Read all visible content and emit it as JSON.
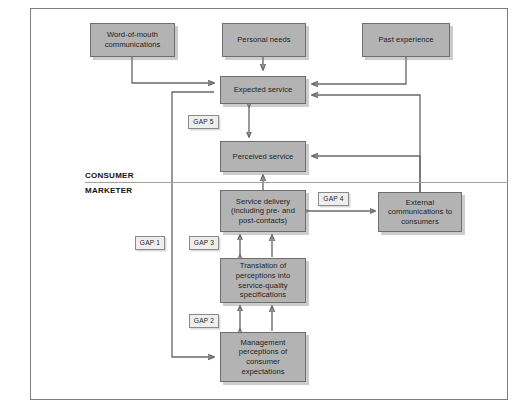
{
  "diagram": {
    "colors": {
      "box_fill": "#b3b3b3",
      "box_border": "#6e6e6e",
      "gap_fill": "#eeeeee",
      "gap_border": "#8a8a8a",
      "wire": "#6a6a6a",
      "frame_border": "#7d7d7d",
      "background": "#ffffff"
    },
    "segment_labels": {
      "consumer": "CONSUMER",
      "marketer": "MARKETER"
    },
    "boxes": [
      {
        "id": "word-of-mouth",
        "label": "Word-of-mouth communications"
      },
      {
        "id": "personal-needs",
        "label": "Personal needs"
      },
      {
        "id": "past-experience",
        "label": "Past experience"
      },
      {
        "id": "expected-service",
        "label": "Expected service"
      },
      {
        "id": "perceived-service",
        "label": "Perceived service"
      },
      {
        "id": "service-delivery",
        "label": "Service delivery (including pre- and post-contacts)"
      },
      {
        "id": "external-communications",
        "label": "External communications to consumers"
      },
      {
        "id": "translation",
        "label": "Translation of perceptions into service-quality specifications"
      },
      {
        "id": "management-perceptions",
        "label": "Management perceptions of consumer expectations"
      }
    ],
    "gaps": [
      {
        "id": "gap-1",
        "label": "GAP 1"
      },
      {
        "id": "gap-2",
        "label": "GAP 2"
      },
      {
        "id": "gap-3",
        "label": "GAP 3"
      },
      {
        "id": "gap-4",
        "label": "GAP 4"
      },
      {
        "id": "gap-5",
        "label": "GAP 5"
      }
    ]
  }
}
